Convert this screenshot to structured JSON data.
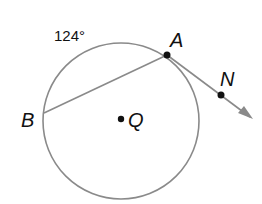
{
  "diagram": {
    "type": "circle-geometry",
    "circle": {
      "center_label": "Q",
      "cx": 121,
      "cy": 119,
      "r": 78
    },
    "points": [
      {
        "label": "A",
        "x": 167,
        "y": 55
      },
      {
        "label": "B",
        "x": 44,
        "y": 113
      },
      {
        "label": "N",
        "x": 221,
        "y": 95
      },
      {
        "label": "Q",
        "x": 121,
        "y": 119
      }
    ],
    "arc_label": "124°",
    "segments": [
      {
        "from": "B",
        "to": "A"
      }
    ],
    "rays": [
      {
        "from": "A",
        "through": "N"
      }
    ],
    "colors": {
      "line": "#8a8a8a",
      "point": "#111111",
      "text": "#111111"
    }
  },
  "labels": {
    "arc": "124°",
    "A": "A",
    "B": "B",
    "N": "N",
    "Q": "Q"
  }
}
